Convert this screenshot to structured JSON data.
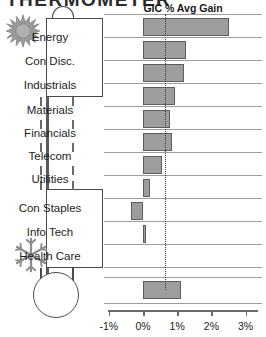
{
  "clipped_title": "THERMOMETER",
  "thermometer": {
    "hot_icon": "sun-icon",
    "cold_icon": "snowflake-icon",
    "top_group": [
      "Energy",
      "Con Disc.",
      "Industrials"
    ],
    "middle_group": [
      "Materials",
      "Financials",
      "Telecom",
      "Utilities"
    ],
    "bottom_group": [
      "Con Staples",
      "Info Tech",
      "Health Care"
    ]
  },
  "chart_data": {
    "type": "bar",
    "orientation": "horizontal",
    "title": "GIC % Avg Gain",
    "xlabel": "",
    "ylabel": "",
    "categories": [
      "Energy",
      "Con Disc.",
      "Industrials",
      "Materials",
      "Financials",
      "Telecom",
      "Utilities",
      "Con Staples",
      "Info Tech",
      "Health Care",
      "Total"
    ],
    "values": [
      2.5,
      1.25,
      1.2,
      0.95,
      0.8,
      0.85,
      0.55,
      0.2,
      -0.35,
      0.05,
      1.1
    ],
    "xlim": [
      -1,
      3
    ],
    "xticks": [
      -1,
      0,
      1,
      2,
      3
    ],
    "xticklabels": [
      "-1%",
      "0%",
      "1%",
      "2%",
      "3%"
    ],
    "reference_line": 0.65,
    "grid": true,
    "bar_fill": "#9d9d9d",
    "bar_stroke": "#5e5e5e",
    "legend": null
  }
}
